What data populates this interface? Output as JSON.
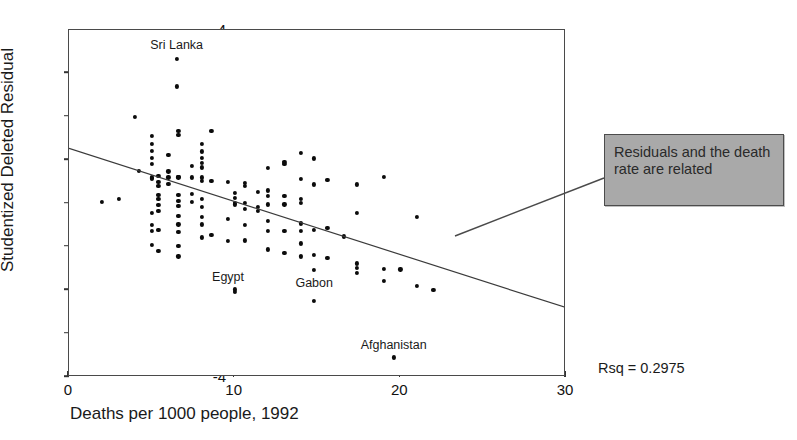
{
  "figure": {
    "cut_title": "Studentized Residuals",
    "rsq_label": "Rsq = 0.2975",
    "callout_text": "Residuals and the death rate are related",
    "frame_color": "#4a4a4a",
    "point_color": "#0b0b0b",
    "callout_fill": "#a9a9a9",
    "callout_border": "#4c4c4c"
  },
  "chart_data": {
    "type": "scatter",
    "title": "",
    "xlabel": "Deaths per 1000 people, 1992",
    "ylabel": "Studentized Deleted Residual",
    "xlim": [
      0,
      30
    ],
    "ylim": [
      -4,
      4
    ],
    "xticks": [
      0,
      10,
      20,
      30
    ],
    "yticks": [
      4,
      3,
      2,
      1,
      0,
      -1,
      -2,
      -3,
      -4
    ],
    "grid": false,
    "legend": null,
    "annotations": [
      {
        "text": "Sri Lanka",
        "x": 6.5,
        "y": 3.62
      },
      {
        "text": "Egypt",
        "x": 9.6,
        "y": -1.72
      },
      {
        "text": "Gabon",
        "x": 14.8,
        "y": -1.86
      },
      {
        "text": "Afghanistan",
        "x": 19.6,
        "y": -3.28
      }
    ],
    "fit_line": {
      "label": "least-squares fit",
      "x0": 0,
      "y0": 1.27,
      "x1": 30,
      "y1": -2.4,
      "slope": -0.1223,
      "intercept": 1.27,
      "rsq": 0.2975
    },
    "points": [
      [
        2.0,
        0.04
      ],
      [
        3.0,
        0.1
      ],
      [
        4.0,
        1.99
      ],
      [
        4.2,
        0.76
      ],
      [
        5.0,
        1.55
      ],
      [
        5.0,
        1.38
      ],
      [
        5.0,
        1.21
      ],
      [
        5.0,
        1.05
      ],
      [
        5.0,
        0.92
      ],
      [
        5.0,
        0.6
      ],
      [
        5.0,
        0.58
      ],
      [
        5.0,
        -0.22
      ],
      [
        5.0,
        -0.5
      ],
      [
        5.0,
        -0.64
      ],
      [
        5.0,
        -0.95
      ],
      [
        5.4,
        0.64
      ],
      [
        5.4,
        0.5
      ],
      [
        5.4,
        0.4
      ],
      [
        5.4,
        0.2
      ],
      [
        5.4,
        0.1
      ],
      [
        5.4,
        -0.03
      ],
      [
        5.4,
        -0.17
      ],
      [
        5.4,
        -0.6
      ],
      [
        5.4,
        -1.1
      ],
      [
        6.0,
        1.12
      ],
      [
        6.0,
        0.74
      ],
      [
        6.0,
        0.6
      ],
      [
        6.0,
        0.46
      ],
      [
        6.5,
        3.33
      ],
      [
        6.5,
        2.7
      ],
      [
        6.6,
        1.67
      ],
      [
        6.6,
        1.58
      ],
      [
        6.6,
        0.62
      ],
      [
        6.6,
        0.6
      ],
      [
        6.6,
        0.2
      ],
      [
        6.6,
        0.06
      ],
      [
        6.6,
        -0.05
      ],
      [
        6.6,
        -0.28
      ],
      [
        6.6,
        -0.48
      ],
      [
        6.6,
        -0.66
      ],
      [
        6.6,
        -0.98
      ],
      [
        6.6,
        -1.22
      ],
      [
        7.4,
        0.86
      ],
      [
        7.4,
        0.6
      ],
      [
        7.4,
        0.22
      ],
      [
        7.4,
        0.03
      ],
      [
        8.0,
        1.37
      ],
      [
        8.0,
        1.2
      ],
      [
        8.0,
        1.06
      ],
      [
        8.0,
        0.94
      ],
      [
        8.0,
        0.83
      ],
      [
        8.0,
        0.6
      ],
      [
        8.0,
        0.52
      ],
      [
        8.0,
        0.11
      ],
      [
        8.0,
        -0.08
      ],
      [
        8.0,
        -0.3
      ],
      [
        8.0,
        -0.48
      ],
      [
        8.0,
        -0.78
      ],
      [
        8.6,
        1.68
      ],
      [
        8.6,
        0.52
      ],
      [
        8.6,
        -0.72
      ],
      [
        9.6,
        0.5
      ],
      [
        9.6,
        -0.35
      ],
      [
        9.6,
        -0.86
      ],
      [
        10.0,
        0.24
      ],
      [
        10.0,
        0.13
      ],
      [
        10.0,
        0.02
      ],
      [
        10.0,
        -0.02
      ],
      [
        10.0,
        -1.98
      ],
      [
        10.0,
        -2.04
      ],
      [
        10.6,
        0.48
      ],
      [
        10.6,
        0.4
      ],
      [
        10.6,
        0.02
      ],
      [
        10.6,
        -0.12
      ],
      [
        10.6,
        -0.5
      ],
      [
        10.6,
        -0.85
      ],
      [
        11.4,
        0.26
      ],
      [
        11.4,
        -0.08
      ],
      [
        11.4,
        -0.18
      ],
      [
        12.0,
        0.82
      ],
      [
        12.0,
        0.3
      ],
      [
        12.0,
        0.18
      ],
      [
        12.0,
        -0.02
      ],
      [
        12.0,
        -0.4
      ],
      [
        12.0,
        -0.64
      ],
      [
        12.0,
        -1.06
      ],
      [
        13.0,
        0.96
      ],
      [
        13.0,
        0.92
      ],
      [
        13.0,
        0.18
      ],
      [
        13.0,
        -0.02
      ],
      [
        13.0,
        -0.64
      ],
      [
        13.0,
        -1.14
      ],
      [
        14.0,
        1.16
      ],
      [
        14.0,
        0.56
      ],
      [
        14.0,
        0.1
      ],
      [
        14.0,
        0.02
      ],
      [
        14.0,
        -0.46
      ],
      [
        14.0,
        -0.64
      ],
      [
        14.0,
        -0.92
      ],
      [
        14.0,
        -1.22
      ],
      [
        14.8,
        1.04
      ],
      [
        14.8,
        0.44
      ],
      [
        14.8,
        -0.6
      ],
      [
        14.8,
        -1.18
      ],
      [
        14.8,
        -1.54
      ],
      [
        14.8,
        -2.24
      ],
      [
        15.6,
        0.54
      ],
      [
        15.6,
        -0.56
      ],
      [
        15.6,
        -1.26
      ],
      [
        16.6,
        -0.76
      ],
      [
        17.4,
        0.44
      ],
      [
        17.4,
        -0.22
      ],
      [
        17.4,
        -1.38
      ],
      [
        17.4,
        -1.48
      ],
      [
        17.4,
        -1.6
      ],
      [
        19.0,
        0.62
      ],
      [
        19.0,
        -1.5
      ],
      [
        19.0,
        -1.78
      ],
      [
        19.6,
        -3.55
      ],
      [
        20.0,
        -1.52
      ],
      [
        21.0,
        -0.3
      ],
      [
        21.0,
        -1.9
      ],
      [
        22.0,
        -2.0
      ]
    ]
  },
  "axis_tick_text": {
    "y": [
      "4",
      "3",
      "2",
      "1",
      "0",
      "-1",
      "-2",
      "-3",
      "-4"
    ],
    "x": [
      "0",
      "10",
      "20",
      "30"
    ]
  }
}
